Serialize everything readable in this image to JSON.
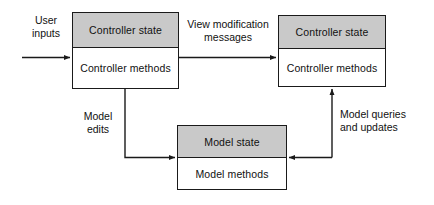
{
  "diagram": {
    "colors": {
      "state_fill": "#c9c9c9",
      "methods_fill": "#ffffff",
      "stroke": "#1a1a1a",
      "background": "#ffffff",
      "text": "#111111"
    },
    "nodes": [
      {
        "id": "controller-left",
        "state_label": "Controller state",
        "methods_label": "Controller methods"
      },
      {
        "id": "controller-right",
        "state_label": "Controller state",
        "methods_label": "Controller methods"
      },
      {
        "id": "model",
        "state_label": "Model state",
        "methods_label": "Model methods"
      }
    ],
    "edges": [
      {
        "id": "user-inputs",
        "label": "User\ninputs",
        "from": "external",
        "to": "controller-left",
        "direction": "right"
      },
      {
        "id": "view-modification-messages",
        "label": "View modification\nmessages",
        "from": "controller-left",
        "to": "controller-right",
        "direction": "right"
      },
      {
        "id": "model-edits",
        "label": "Model\nedits",
        "from": "controller-left",
        "to": "model",
        "direction": "right"
      },
      {
        "id": "model-queries-and-updates",
        "label": "Model queries\nand updates",
        "from": "model",
        "to": "controller-right",
        "direction": "up"
      }
    ]
  }
}
